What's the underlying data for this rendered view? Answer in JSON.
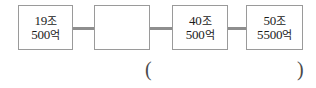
{
  "diagram": {
    "type": "connected-boxes-sequence",
    "boxes": [
      {
        "name": "box-1",
        "filled": true,
        "lines": [
          {
            "number": "19",
            "unit": "조"
          },
          {
            "number": "500",
            "unit": "억"
          }
        ],
        "text": "19조 500억"
      },
      {
        "name": "box-2",
        "filled": false,
        "lines": [],
        "text": ""
      },
      {
        "name": "box-3",
        "filled": true,
        "lines": [
          {
            "number": "40",
            "unit": "조"
          },
          {
            "number": "500",
            "unit": "억"
          }
        ],
        "text": "40조 500억"
      },
      {
        "name": "box-4",
        "filled": true,
        "lines": [
          {
            "number": "50",
            "unit": "조"
          },
          {
            "number": "5500",
            "unit": "억"
          }
        ],
        "text": "50조 5500억"
      }
    ],
    "connectors": 3
  },
  "answer_blank": {
    "open_paren": "(",
    "close_paren": ")",
    "value": ""
  },
  "colors": {
    "background": "#ffffff",
    "box_border": "#9a9a9a",
    "connector": "#8e8e8e",
    "text": "#1b1b1b",
    "paren": "#4a4a4a"
  }
}
